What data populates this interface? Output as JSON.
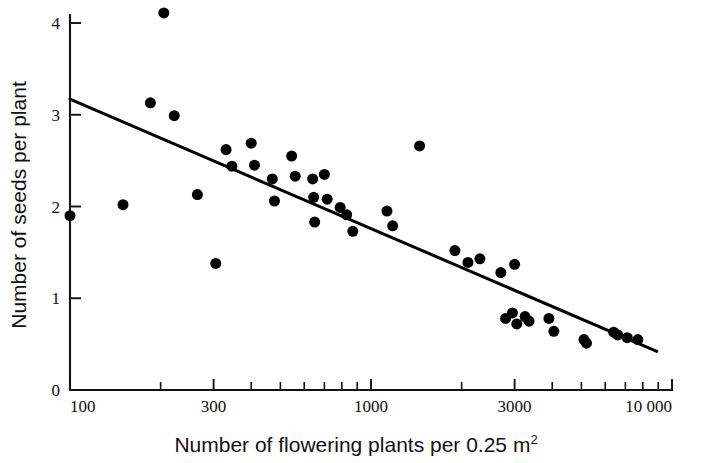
{
  "figure": {
    "name": "seeds-per-plant-vs-flowering-plant-density-scatter",
    "background_color": "#ffffff",
    "ink_color": "#000000"
  },
  "chart_data": {
    "type": "scatter",
    "title": "",
    "subtitle": "",
    "xlabel": "Number of flowering plants per 0.25 m",
    "xlabel_superscript": "2",
    "ylabel": "Number of seeds per plant",
    "xscale": "log",
    "yscale": "linear",
    "xlim": [
      100,
      10000
    ],
    "ylim": [
      0,
      4.25
    ],
    "grid": false,
    "legend": false,
    "legend_position": "none",
    "x_tick_labels": [
      "100",
      "300",
      "1000",
      "3000",
      "10 000"
    ],
    "x_tick_values": [
      100,
      300,
      1000,
      3000,
      10000
    ],
    "x_minor_tick_values": [
      200,
      400,
      500,
      600,
      700,
      800,
      900,
      2000,
      4000,
      5000,
      6000,
      7000,
      8000,
      9000
    ],
    "y_tick_labels": [
      "0",
      "1",
      "2",
      "3",
      "4"
    ],
    "y_tick_values": [
      0,
      1,
      2,
      3,
      4
    ],
    "marker": "filled-circle",
    "marker_color": "#000000",
    "marker_size_px": 11,
    "points": [
      {
        "x": 100,
        "y": 1.9
      },
      {
        "x": 150,
        "y": 2.02
      },
      {
        "x": 185,
        "y": 3.13
      },
      {
        "x": 205,
        "y": 4.11
      },
      {
        "x": 222,
        "y": 2.99
      },
      {
        "x": 265,
        "y": 2.13
      },
      {
        "x": 305,
        "y": 1.38
      },
      {
        "x": 330,
        "y": 2.62
      },
      {
        "x": 345,
        "y": 2.44
      },
      {
        "x": 400,
        "y": 2.69
      },
      {
        "x": 410,
        "y": 2.45
      },
      {
        "x": 470,
        "y": 2.3
      },
      {
        "x": 478,
        "y": 2.06
      },
      {
        "x": 545,
        "y": 2.55
      },
      {
        "x": 560,
        "y": 2.33
      },
      {
        "x": 640,
        "y": 2.3
      },
      {
        "x": 645,
        "y": 2.1
      },
      {
        "x": 650,
        "y": 1.83
      },
      {
        "x": 700,
        "y": 2.35
      },
      {
        "x": 715,
        "y": 2.08
      },
      {
        "x": 790,
        "y": 1.99
      },
      {
        "x": 830,
        "y": 1.91
      },
      {
        "x": 870,
        "y": 1.73
      },
      {
        "x": 1130,
        "y": 1.95
      },
      {
        "x": 1180,
        "y": 1.79
      },
      {
        "x": 1450,
        "y": 2.66
      },
      {
        "x": 1900,
        "y": 1.52
      },
      {
        "x": 2100,
        "y": 1.39
      },
      {
        "x": 2300,
        "y": 1.43
      },
      {
        "x": 2700,
        "y": 1.28
      },
      {
        "x": 2800,
        "y": 0.78
      },
      {
        "x": 2950,
        "y": 0.84
      },
      {
        "x": 3000,
        "y": 1.37
      },
      {
        "x": 3050,
        "y": 0.72
      },
      {
        "x": 3250,
        "y": 0.8
      },
      {
        "x": 3350,
        "y": 0.75
      },
      {
        "x": 3900,
        "y": 0.78
      },
      {
        "x": 4050,
        "y": 0.64
      },
      {
        "x": 5100,
        "y": 0.55
      },
      {
        "x": 5200,
        "y": 0.51
      },
      {
        "x": 6400,
        "y": 0.63
      },
      {
        "x": 6600,
        "y": 0.6
      },
      {
        "x": 7100,
        "y": 0.57
      },
      {
        "x": 7700,
        "y": 0.55
      }
    ],
    "fit_line": {
      "name": "regression-line",
      "x_start": 100,
      "y_start": 3.17,
      "x_end": 8900,
      "y_end": 0.42,
      "style": "solid",
      "color": "#000000"
    }
  }
}
